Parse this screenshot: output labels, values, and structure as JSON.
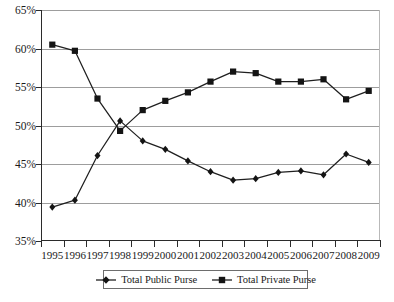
{
  "chart_data": {
    "type": "line",
    "title": "",
    "subtitle": "",
    "xlabel": "",
    "ylabel": "",
    "categories": [
      "1995",
      "1996",
      "1997",
      "1998",
      "1999",
      "2000",
      "2001",
      "2002",
      "2003",
      "2004",
      "2005",
      "2006",
      "2007",
      "2008",
      "2009"
    ],
    "x": [
      1995,
      1996,
      1997,
      1998,
      1999,
      2000,
      2001,
      2002,
      2003,
      2004,
      2005,
      2006,
      2007,
      2008,
      2009
    ],
    "ylim": [
      35,
      65
    ],
    "ytick_values": [
      35,
      40,
      45,
      50,
      55,
      60,
      65
    ],
    "ytick_labels": [
      "35%",
      "40%",
      "45%",
      "50%",
      "55%",
      "60%",
      "65%"
    ],
    "grid": true,
    "grid_axis": "y",
    "legend_position": "bottom-center",
    "series": [
      {
        "name": "Total Public Purse",
        "marker": "diamond",
        "color": "#141414",
        "values": [
          39.4,
          40.3,
          46.1,
          50.6,
          48.0,
          46.9,
          45.4,
          44.0,
          42.9,
          43.1,
          43.9,
          44.1,
          43.6,
          46.3,
          45.2
        ]
      },
      {
        "name": "Total Private Purse",
        "marker": "square",
        "color": "#141414",
        "values": [
          60.5,
          59.7,
          53.5,
          49.3,
          52.0,
          53.2,
          54.3,
          55.7,
          57.0,
          56.8,
          55.7,
          55.7,
          56.0,
          53.4,
          54.5
        ]
      }
    ],
    "annotations": []
  },
  "legend": {
    "items": [
      {
        "label": "Total Public Purse",
        "marker": "diamond"
      },
      {
        "label": "Total Private Purse",
        "marker": "square"
      }
    ]
  },
  "colors": {
    "series_stroke": "#1f1f1f",
    "gridline": "#9d9d9d",
    "axis": "#2b2b2b",
    "background": "#ffffff"
  }
}
